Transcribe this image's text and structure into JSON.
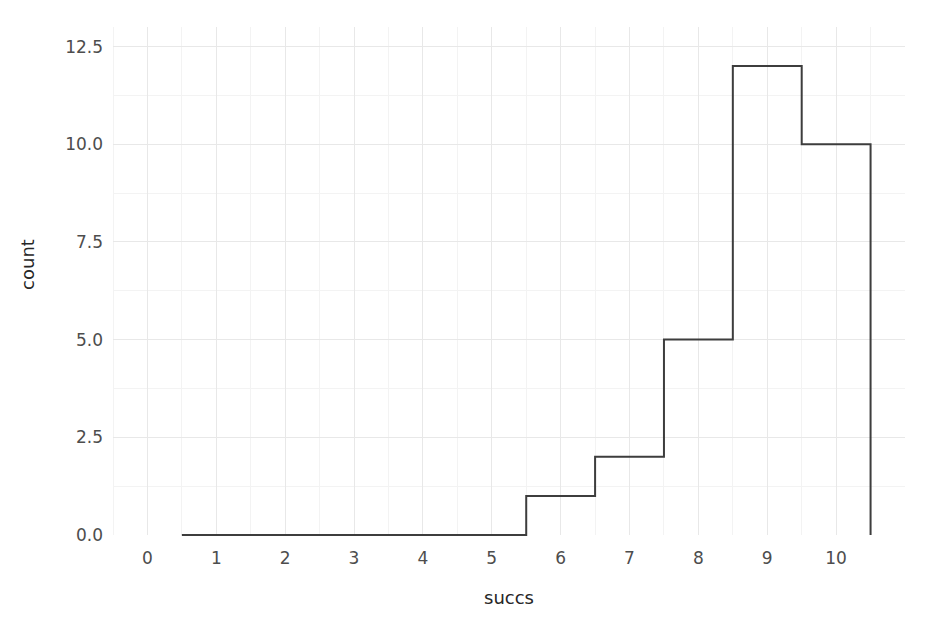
{
  "chart_data": {
    "type": "bar",
    "title": "",
    "xlabel": "succs",
    "ylabel": "count",
    "categories": [
      "6",
      "7",
      "8",
      "9",
      "10"
    ],
    "bin_edges": [
      5.5,
      6.5,
      7.5,
      8.5,
      9.5,
      10.5
    ],
    "values": [
      1,
      2,
      5,
      12,
      10
    ],
    "xlim": [
      -0.5,
      11.0
    ],
    "ylim": [
      0.0,
      13.0
    ],
    "xticks": [
      "0",
      "1",
      "2",
      "3",
      "4",
      "5",
      "6",
      "7",
      "8",
      "9",
      "10"
    ],
    "xtick_values": [
      0,
      1,
      2,
      3,
      4,
      5,
      6,
      7,
      8,
      9,
      10
    ],
    "yticks": [
      "0.0",
      "2.5",
      "5.0",
      "7.5",
      "10.0",
      "12.5"
    ],
    "ytick_values": [
      0.0,
      2.5,
      5.0,
      7.5,
      10.0,
      12.5
    ],
    "grid": true,
    "minor_grid": true,
    "legend": null,
    "baseline_start": 0.5,
    "baseline_end": 10.5,
    "style": {
      "background": "#ffffff",
      "bar_face": "none",
      "bar_edge": "#3d3d3d",
      "bar_edge_width": 2,
      "grid_major_color": "#e8e8e8",
      "grid_minor_color": "#f3f3f3",
      "tick_label_color": "#4d4d4d",
      "axis_label_color": "#262626"
    }
  }
}
